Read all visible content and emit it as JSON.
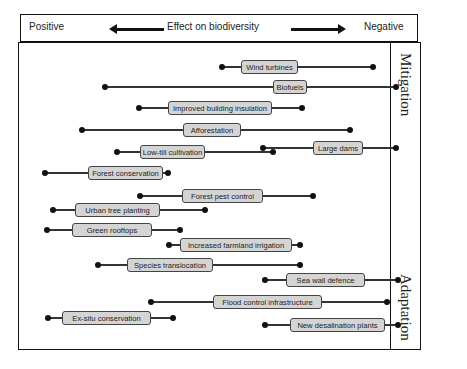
{
  "header": {
    "left_label": "Positive",
    "center_label": "Effect on biodiversity",
    "right_label": "Negative",
    "left_arrow_icon": "arrow-left-icon",
    "right_arrow_icon": "arrow-right-icon"
  },
  "side_panel": {
    "top_label": "Mitigation",
    "bottom_label": "Adaptation"
  },
  "colors": {
    "box_fill": "#d4d4d4",
    "line": "#333333",
    "dot": "#111111",
    "border": "#111111"
  },
  "chart_data": {
    "type": "range",
    "title": "Effect on biodiversity",
    "xlabel": "Positive ← Effect on biodiversity → Negative",
    "groups": [
      "Mitigation",
      "Adaptation"
    ],
    "items": [
      {
        "label": "Wind turbines",
        "y": 67,
        "x_min": 222,
        "x_max": 373,
        "box_left": 241,
        "box_width": 57,
        "group": "Mitigation"
      },
      {
        "label": "Biofuels",
        "y": 87,
        "x_min": 105,
        "x_max": 396,
        "box_left": 273,
        "box_width": 34,
        "group": "Mitigation"
      },
      {
        "label": "Improved building insulation",
        "y": 108,
        "x_min": 139,
        "x_max": 302,
        "box_left": 168,
        "box_width": 104,
        "group": "Mitigation"
      },
      {
        "label": "Afforestation",
        "y": 130,
        "x_min": 82,
        "x_max": 350,
        "box_left": 183,
        "box_width": 58,
        "group": "Mitigation"
      },
      {
        "label": "Large dams",
        "y": 148,
        "x_min": 263,
        "x_max": 396,
        "box_left": 313,
        "box_width": 50,
        "group": "Mitigation"
      },
      {
        "label": "Low-till cultivation",
        "y": 152,
        "x_min": 117,
        "x_max": 273,
        "box_left": 140,
        "box_width": 65,
        "group": "Mitigation"
      },
      {
        "label": "Forest conservation",
        "y": 173,
        "x_min": 45,
        "x_max": 168,
        "box_left": 88,
        "box_width": 75,
        "group": "Mitigation"
      },
      {
        "label": "Forest pest control",
        "y": 196,
        "x_min": 140,
        "x_max": 313,
        "box_left": 182,
        "box_width": 81,
        "group": "Adaptation"
      },
      {
        "label": "Urban tree planting",
        "y": 210,
        "x_min": 53,
        "x_max": 205,
        "box_left": 75,
        "box_width": 85,
        "group": "Adaptation"
      },
      {
        "label": "Green rooftops",
        "y": 230,
        "x_min": 47,
        "x_max": 180,
        "box_left": 72,
        "box_width": 80,
        "group": "Adaptation"
      },
      {
        "label": "Increased farmland irrigation",
        "y": 245,
        "x_min": 169,
        "x_max": 300,
        "box_left": 180,
        "box_width": 112,
        "group": "Adaptation"
      },
      {
        "label": "Species translocation",
        "y": 265,
        "x_min": 98,
        "x_max": 300,
        "box_left": 127,
        "box_width": 86,
        "group": "Adaptation"
      },
      {
        "label": "Sea wall defence",
        "y": 280,
        "x_min": 265,
        "x_max": 398,
        "box_left": 286,
        "box_width": 79,
        "group": "Adaptation"
      },
      {
        "label": "Flood control infrastructure",
        "y": 302,
        "x_min": 151,
        "x_max": 387,
        "box_left": 213,
        "box_width": 109,
        "group": "Adaptation"
      },
      {
        "label": "Ex-situ conservation",
        "y": 318,
        "x_min": 48,
        "x_max": 173,
        "box_left": 62,
        "box_width": 89,
        "group": "Adaptation"
      },
      {
        "label": "New desalination plants",
        "y": 325,
        "x_min": 265,
        "x_max": 398,
        "box_left": 290,
        "box_width": 95,
        "group": "Adaptation"
      }
    ]
  }
}
